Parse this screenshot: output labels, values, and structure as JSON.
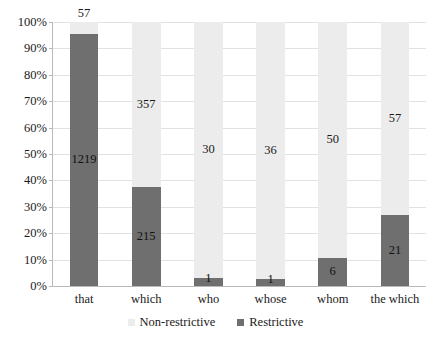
{
  "chart_data": {
    "type": "bar",
    "subtype": "stacked-percentage",
    "title": "",
    "subtitle": "",
    "xlabel": "",
    "ylabel": "",
    "ylim": [
      0,
      100
    ],
    "grid": true,
    "legend_position": "bottom-center",
    "categories": [
      "that",
      "which",
      "who",
      "whose",
      "whom",
      "the which"
    ],
    "ytick_labels": [
      "0%",
      "10%",
      "20%",
      "30%",
      "40%",
      "50%",
      "60%",
      "70%",
      "80%",
      "90%",
      "100%"
    ],
    "ytick_values": [
      0,
      10,
      20,
      30,
      40,
      50,
      60,
      70,
      80,
      90,
      100
    ],
    "series": [
      {
        "name": "Restrictive",
        "color": "#6f6f6f",
        "values": [
          1219,
          215,
          1,
          1,
          6,
          21
        ],
        "percents": [
          95.5,
          37.6,
          3.2,
          2.7,
          10.7,
          26.9
        ]
      },
      {
        "name": "Non-restrictive",
        "color": "#ececec",
        "values": [
          57,
          357,
          30,
          36,
          50,
          57
        ],
        "percents": [
          4.5,
          62.4,
          96.8,
          97.3,
          89.3,
          73.1
        ]
      }
    ],
    "legend": [
      "Non-restrictive",
      "Restrictive"
    ]
  },
  "colors": {
    "restrictive": "#6f6f6f",
    "non_restrictive": "#ececec",
    "axis": "#b9b9b9",
    "gridline": "#e2e2e2",
    "text": "#1a1a1a",
    "background": "#ffffff"
  }
}
